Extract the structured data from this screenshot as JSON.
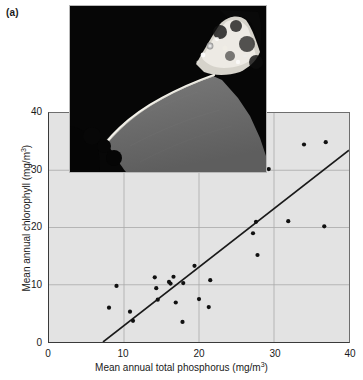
{
  "figure": {
    "panel_label": "(a)",
    "type": "scatter-with-regression-and-inset-photo"
  },
  "inset": {
    "name": "shoreline-aerial-photograph",
    "description": "Grayscale aerial photograph of a lake shoreline with dark land and gray water",
    "colors": {
      "land_dark": "#050505",
      "water_gray": "#6d6d6d",
      "shore_bright": "#f2f0e8"
    }
  },
  "axes": {
    "x_tick_labels": [
      "0",
      "10",
      "20",
      "30",
      "40"
    ],
    "y_tick_labels": [
      "0",
      "10",
      "20",
      "30",
      "40"
    ],
    "x_title_main": "Mean annual total phosphorus (mg/m",
    "x_title_sup": "3",
    "x_title_tail": ")",
    "y_title_main": "Mean annual chlorophyll (mg/m",
    "y_title_sup": "3",
    "y_title_tail": ")"
  },
  "chart_data": {
    "type": "scatter",
    "title": "",
    "xlabel": "Mean annual total phosphorus (mg/m3)",
    "ylabel": "Mean annual chlorophyll (mg/m3)",
    "xlim": [
      0,
      40
    ],
    "ylim": [
      0,
      40
    ],
    "xticks": [
      0,
      10,
      20,
      30,
      40
    ],
    "yticks": [
      0,
      10,
      20,
      30,
      40
    ],
    "grid": true,
    "legend": "none",
    "marker": {
      "shape": "circle",
      "color": "#111111",
      "size_px": 4
    },
    "points": [
      {
        "x": 8.0,
        "y": 6.0
      },
      {
        "x": 9.0,
        "y": 9.8
      },
      {
        "x": 10.8,
        "y": 5.3
      },
      {
        "x": 11.2,
        "y": 3.7
      },
      {
        "x": 14.1,
        "y": 11.3
      },
      {
        "x": 14.3,
        "y": 9.4
      },
      {
        "x": 14.5,
        "y": 7.4
      },
      {
        "x": 16.0,
        "y": 10.5
      },
      {
        "x": 16.2,
        "y": 10.2
      },
      {
        "x": 16.6,
        "y": 11.4
      },
      {
        "x": 16.9,
        "y": 6.9
      },
      {
        "x": 17.8,
        "y": 3.5
      },
      {
        "x": 17.9,
        "y": 10.3
      },
      {
        "x": 19.4,
        "y": 13.3
      },
      {
        "x": 20.0,
        "y": 7.5
      },
      {
        "x": 21.3,
        "y": 6.1
      },
      {
        "x": 21.5,
        "y": 10.8
      },
      {
        "x": 27.2,
        "y": 19.0
      },
      {
        "x": 27.6,
        "y": 21.0
      },
      {
        "x": 27.8,
        "y": 15.2
      },
      {
        "x": 29.3,
        "y": 30.2
      },
      {
        "x": 31.9,
        "y": 21.1
      },
      {
        "x": 34.0,
        "y": 34.5
      },
      {
        "x": 36.7,
        "y": 20.2
      },
      {
        "x": 36.9,
        "y": 34.9
      }
    ],
    "regression_line": {
      "x_start": 7.2,
      "y_start": 0.0,
      "x_end": 40.0,
      "y_end": 33.5,
      "color": "#1a1a1a"
    }
  },
  "colors": {
    "plot_background": "#e3e3e3",
    "gridline": "#a9a9a9",
    "axis": "#3a3a3a",
    "text": "#1a1a1a",
    "page_background": "#ffffff"
  }
}
